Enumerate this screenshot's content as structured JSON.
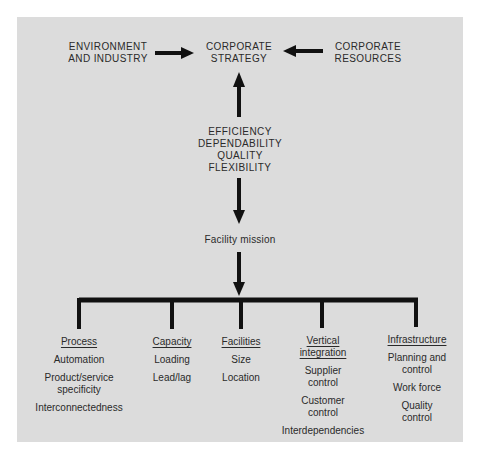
{
  "top_row": {
    "left": {
      "line1": "ENVIRONMENT",
      "line2": "AND INDUSTRY"
    },
    "center": {
      "line1": "CORPORATE",
      "line2": "STRATEGY"
    },
    "right": {
      "line1": "CORPORATE",
      "line2": "RESOURCES"
    }
  },
  "criteria": [
    "EFFICIENCY",
    "DEPENDABILITY",
    "QUALITY",
    "FLEXIBILITY"
  ],
  "mission": "Facility mission",
  "branches": [
    {
      "heading": "Process",
      "items": [
        "Automation",
        "Product/service specificity",
        "Interconnectedness"
      ]
    },
    {
      "heading": "Capacity",
      "items": [
        "Loading",
        "Lead/lag"
      ]
    },
    {
      "heading": "Facilities",
      "items": [
        "Size",
        "Location"
      ]
    },
    {
      "heading": "Vertical integration",
      "items": [
        "Supplier control",
        "Customer control",
        "Interdependencies"
      ]
    },
    {
      "heading": "Infrastructure",
      "items": [
        "Planning and control",
        "Work force",
        "Quality control"
      ]
    }
  ],
  "colors": {
    "panel": "#dcdcdc",
    "ink": "#111111",
    "text": "#2a2a2a"
  }
}
